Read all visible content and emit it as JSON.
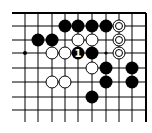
{
  "board": {
    "cols": [
      25,
      38,
      52,
      65,
      78,
      92,
      106,
      119,
      132,
      146
    ],
    "rows": [
      13,
      26,
      40,
      53,
      68,
      82,
      97,
      110
    ],
    "left_extent": 12,
    "bottom_extent": 122,
    "top_edge": true,
    "right_edge": true,
    "stone_radius": 6,
    "colors": {
      "black": "#000000",
      "white": "#ffffff",
      "line": "#000000"
    }
  },
  "stones": [
    {
      "color": "black",
      "c": 3,
      "r": 1
    },
    {
      "color": "black",
      "c": 4,
      "r": 1
    },
    {
      "color": "black",
      "c": 5,
      "r": 1
    },
    {
      "color": "black",
      "c": 6,
      "r": 1
    },
    {
      "color": "white",
      "c": 7,
      "r": 1,
      "marked": true
    },
    {
      "color": "black",
      "c": 1,
      "r": 2
    },
    {
      "color": "black",
      "c": 2,
      "r": 2
    },
    {
      "color": "white",
      "c": 4,
      "r": 2
    },
    {
      "color": "white",
      "c": 5,
      "r": 2
    },
    {
      "color": "white",
      "c": 7,
      "r": 2,
      "marked": true
    },
    {
      "color": "white",
      "c": 2,
      "r": 3
    },
    {
      "color": "white",
      "c": 3,
      "r": 3
    },
    {
      "color": "black",
      "c": 4,
      "r": 3,
      "label": "1"
    },
    {
      "color": "black",
      "c": 5,
      "r": 3
    },
    {
      "color": "white",
      "c": 7,
      "r": 3,
      "marked": true
    },
    {
      "color": "white",
      "c": 5,
      "r": 4
    },
    {
      "color": "black",
      "c": 6,
      "r": 4
    },
    {
      "color": "black",
      "c": 8,
      "r": 4
    },
    {
      "color": "white",
      "c": 2,
      "r": 5
    },
    {
      "color": "white",
      "c": 3,
      "r": 5
    },
    {
      "color": "black",
      "c": 6,
      "r": 5
    },
    {
      "color": "black",
      "c": 8,
      "r": 5
    },
    {
      "color": "black",
      "c": 5,
      "r": 6
    }
  ],
  "points": [
    {
      "type": "star",
      "c": 0,
      "r": 3
    },
    {
      "type": "small-dot",
      "c": 6,
      "r": 3
    }
  ]
}
